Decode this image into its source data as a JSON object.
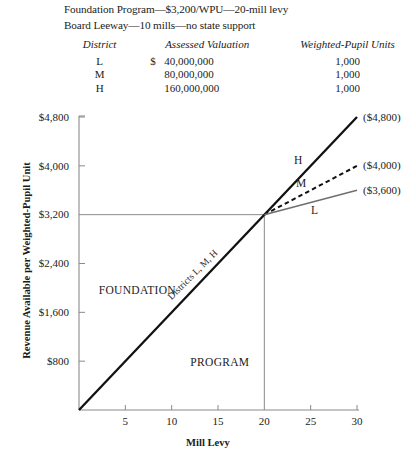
{
  "header": {
    "line1": "Foundation Program—$3,200/WPU—20-mill levy",
    "line2": "Board Leeway—10 mills—no state support"
  },
  "table": {
    "headers": [
      "District",
      "Assessed Valuation",
      "Weighted-Pupil Units"
    ],
    "rows": [
      {
        "district": "L",
        "dollar": "$",
        "valuation": "40,000,000",
        "wpu": "1,000"
      },
      {
        "district": "M",
        "dollar": "",
        "valuation": "80,000,000",
        "wpu": "1,000"
      },
      {
        "district": "H",
        "dollar": "",
        "valuation": "160,000,000",
        "wpu": "1,000"
      }
    ]
  },
  "chart_data": {
    "type": "line",
    "title": "",
    "xlabel": "Mill Levy",
    "ylabel": "Revenue Available per Weighted-Pupil Unit",
    "xlim": [
      0,
      30
    ],
    "ylim": [
      0,
      4800
    ],
    "xticks": [
      5,
      10,
      15,
      20,
      25,
      30
    ],
    "xtick_labels": [
      "5",
      "10",
      "15",
      "20",
      "25",
      "30"
    ],
    "yticks": [
      800,
      1600,
      2400,
      3200,
      4000,
      4800
    ],
    "ytick_labels": [
      "$800",
      "$1,600",
      "$2,400",
      "$3,200",
      "$4,000",
      "$4,800"
    ],
    "grid": "partial",
    "gridlines": [
      {
        "type": "horizontal",
        "value": 3200,
        "from_x": 0,
        "to_x": 20
      },
      {
        "type": "vertical",
        "value": 20,
        "from_y": 0,
        "to_y": 3200
      }
    ],
    "legend_position": "inline-right",
    "series": [
      {
        "name": "Districts L, M, H",
        "label": "Districts L, M, H",
        "style": "solid-thick",
        "color": "#111111",
        "x": [
          0,
          20
        ],
        "y": [
          0,
          3200
        ]
      },
      {
        "name": "H",
        "label": "H",
        "endpoint_label": "($4,800)",
        "style": "solid-thick",
        "color": "#111111",
        "x": [
          20,
          30
        ],
        "y": [
          3200,
          4800
        ]
      },
      {
        "name": "M",
        "label": "M",
        "endpoint_label": "($4,000)",
        "style": "dashed",
        "color": "#111111",
        "x": [
          20,
          30
        ],
        "y": [
          3200,
          4000
        ]
      },
      {
        "name": "L",
        "label": "L",
        "endpoint_label": "($3,600)",
        "style": "solid-thin-gray",
        "color": "#6e6e6e",
        "x": [
          20,
          30
        ],
        "y": [
          3200,
          3600
        ]
      }
    ],
    "annotations": [
      {
        "text": "FOUNDATION",
        "x": 6.3,
        "y": 1900
      },
      {
        "text": "PROGRAM",
        "x": 15.2,
        "y": 720
      },
      {
        "text": "Districts L, M, H",
        "x": 12.5,
        "y": 2180,
        "rotation": -45
      }
    ]
  }
}
